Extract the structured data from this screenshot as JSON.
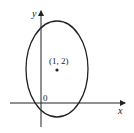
{
  "diagram": {
    "type": "ellipse-on-axes",
    "axes": {
      "x_label": "x",
      "y_label": "y",
      "origin_label": "0"
    },
    "ellipse": {
      "center_label": "(1, 2)",
      "center": [
        1,
        2
      ]
    },
    "colors": {
      "stroke": "#222222",
      "background": "#ffffff"
    }
  }
}
